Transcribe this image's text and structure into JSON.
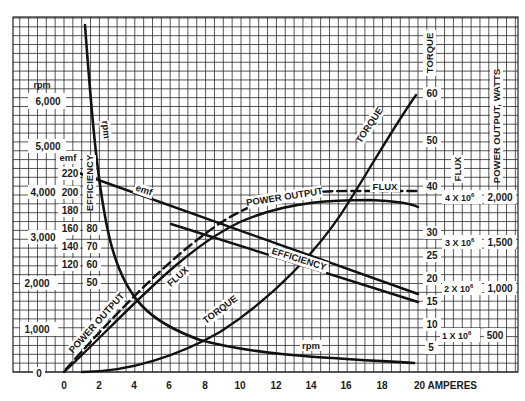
{
  "chart_data": {
    "type": "line",
    "title": "",
    "xlabel": "AMPERES",
    "x_ticks": [
      "0",
      "2",
      "4",
      "6",
      "8",
      "10",
      "12",
      "14",
      "16",
      "18",
      "20 AMPERES"
    ],
    "xlim": [
      0,
      20
    ],
    "grid": true,
    "axes": {
      "rpm": {
        "label": "rpm",
        "ticks": [
          "0",
          "1,000",
          "2,000",
          "3,000",
          "4,000",
          "5,000",
          "6,000"
        ],
        "range": [
          0,
          6000
        ]
      },
      "emf": {
        "label": "emf",
        "ticks": [
          "120",
          "140",
          "160",
          "180",
          "200",
          "220"
        ]
      },
      "efficiency": {
        "label": "EFFICIENCY",
        "ticks": [
          "50",
          "60",
          "70",
          "80"
        ]
      },
      "torque": {
        "label": "TORQUE",
        "ticks": [
          "5",
          "10",
          "15",
          "20",
          "25",
          "30",
          "40",
          "50",
          "60"
        ],
        "range": [
          0,
          60
        ]
      },
      "flux": {
        "label": "FLUX",
        "ticks": [
          "1 X 10⁶",
          "2 X 10⁶",
          "3 X 10⁶",
          "4 X 10⁶"
        ]
      },
      "power_output": {
        "label": "POWER OUTPUT, WATTS",
        "ticks": [
          "500",
          "1,000",
          "1,500",
          "2,000"
        ]
      }
    },
    "series": [
      {
        "name": "rpm",
        "style": "solid",
        "x": [
          1.2,
          2,
          3,
          4,
          5,
          6,
          8,
          10,
          12,
          14,
          16,
          18,
          20
        ],
        "values": [
          6900,
          4300,
          2900,
          2150,
          1700,
          1400,
          1000,
          780,
          640,
          540,
          450,
          380,
          330
        ]
      },
      {
        "name": "emf",
        "style": "solid",
        "x": [
          0.7,
          20
        ],
        "values": [
          210,
          118
        ]
      },
      {
        "name": "EFFICIENCY",
        "style": "solid",
        "x": [
          6,
          20
        ],
        "values": [
          80,
          52
        ]
      },
      {
        "name": "TORQUE",
        "style": "solid",
        "x": [
          1,
          4,
          6,
          8,
          10,
          12,
          14,
          16,
          18,
          20
        ],
        "values": [
          0,
          2,
          5,
          10,
          17,
          25,
          34,
          43,
          52,
          60
        ]
      },
      {
        "name": "FLUX",
        "style": "dashed",
        "x": [
          0,
          2,
          4,
          6,
          8,
          10,
          12,
          14,
          16,
          20
        ],
        "values": [
          0.05,
          1.0,
          1.9,
          2.7,
          3.3,
          3.7,
          3.9,
          3.98,
          4.0,
          4.0
        ]
      },
      {
        "name": "POWER OUTPUT",
        "style": "solid",
        "x": [
          0,
          2,
          4,
          6,
          8,
          10,
          12,
          14,
          16,
          18,
          20
        ],
        "values": [
          0,
          450,
          900,
          1300,
          1600,
          1800,
          1900,
          1950,
          1950,
          1900,
          1830
        ]
      }
    ],
    "annotations": [
      "rpm",
      "emf",
      "EFFICIENCY",
      "TORQUE",
      "FLUX",
      "POWER OUTPUT"
    ]
  },
  "labels": {
    "rpm_top": "rpm",
    "rpm_curve": "rpm",
    "emf_axis": "emf",
    "emf_curve": "emf",
    "efficiency_axis": "EFFICIENCY",
    "efficiency_curve": "EFFICIENCY",
    "torque_axis": "TORQUE",
    "torque_curve_top": "TORQUE",
    "torque_curve_mid": "TORQUE",
    "flux_axis": "FLUX",
    "flux_curve_top": "FLUX",
    "flux_curve_mid": "FLUX",
    "power_axis": "POWER OUTPUT, WATTS",
    "power_curve_top": "POWER OUTPUT",
    "power_curve_low": "POWER OUTPUT",
    "amperes": "20 AMPERES"
  },
  "ticks": {
    "rpm": [
      "0",
      "1,000",
      "2,000",
      "3,000",
      "4,000",
      "5,000",
      "6,000"
    ],
    "emf": [
      "120",
      "140",
      "160",
      "180",
      "200",
      "220"
    ],
    "eff": [
      "50",
      "60",
      "70",
      "80"
    ],
    "x": [
      "0",
      "2",
      "4",
      "6",
      "8",
      "10",
      "12",
      "14",
      "16",
      "18"
    ],
    "torque": [
      "5",
      "10",
      "15",
      "20",
      "25",
      "30",
      "40",
      "50",
      "60"
    ],
    "flux": [
      "1 X 10",
      "2 X 10",
      "3 X 10",
      "4 X 10"
    ],
    "flux_exp": "6",
    "power": [
      "500",
      "1,000",
      "1,500",
      "2,000"
    ]
  }
}
